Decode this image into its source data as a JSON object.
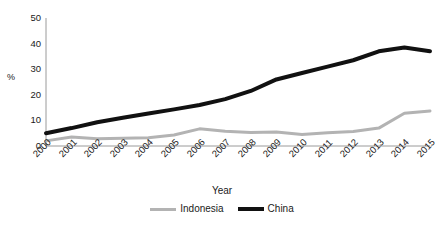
{
  "chart_data": {
    "type": "line",
    "title": "",
    "xlabel": "Year",
    "ylabel": "%",
    "categories": [
      "2000",
      "2001",
      "2002",
      "2003",
      "2004",
      "2005",
      "2006",
      "2007",
      "2008",
      "2009",
      "2010",
      "2011",
      "2012",
      "2013",
      "2014",
      "2015"
    ],
    "x": [
      2000,
      2001,
      2002,
      2003,
      2004,
      2005,
      2006,
      2007,
      2008,
      2009,
      2010,
      2011,
      2012,
      2013,
      2014,
      2015
    ],
    "series": [
      {
        "name": "Indonesia",
        "color": "#b3b3b3",
        "line_width": 3,
        "values": [
          2.0,
          3.5,
          2.8,
          3.0,
          3.2,
          4.3,
          6.7,
          5.8,
          5.3,
          5.5,
          4.5,
          5.2,
          5.7,
          7.0,
          12.8,
          13.7
        ]
      },
      {
        "name": "China",
        "color": "#111111",
        "line_width": 4,
        "values": [
          5.0,
          7.0,
          9.3,
          11.0,
          12.7,
          14.3,
          16.0,
          18.3,
          21.5,
          26.0,
          28.5,
          31.0,
          33.5,
          37.0,
          38.5,
          37.0
        ]
      }
    ],
    "ylim": [
      0,
      50
    ],
    "yticks": [
      0,
      10,
      20,
      30,
      40,
      50
    ],
    "ytick_labels": [
      "0",
      "10",
      "20",
      "30",
      "40",
      "50"
    ],
    "xlim": [
      2000,
      2015
    ],
    "grid": false,
    "legend_position": "bottom",
    "axis_color": "#9a9a9a",
    "xtick_rotation": -45
  },
  "axes": {
    "y_label": "%",
    "x_title": "Year"
  },
  "legend": {
    "items": [
      {
        "label": "Indonesia",
        "color": "#b3b3b3"
      },
      {
        "label": "China",
        "color": "#111111"
      }
    ]
  }
}
